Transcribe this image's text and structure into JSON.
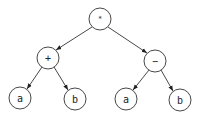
{
  "diagram": {
    "type": "expression-tree",
    "nodes": [
      {
        "id": "root",
        "label": "*",
        "x": 100,
        "y": 19,
        "r": 11
      },
      {
        "id": "plus",
        "label": "+",
        "x": 48,
        "y": 58,
        "r": 11
      },
      {
        "id": "minus",
        "label": "−",
        "x": 155,
        "y": 61,
        "r": 11
      },
      {
        "id": "a1",
        "label": "a",
        "x": 20,
        "y": 98,
        "r": 11
      },
      {
        "id": "b1",
        "label": "b",
        "x": 75,
        "y": 99,
        "r": 11
      },
      {
        "id": "a2",
        "label": "a",
        "x": 126,
        "y": 99,
        "r": 11
      },
      {
        "id": "b2",
        "label": "b",
        "x": 180,
        "y": 100,
        "r": 11
      }
    ],
    "edges": [
      {
        "from": "root",
        "to": "plus"
      },
      {
        "from": "root",
        "to": "minus"
      },
      {
        "from": "plus",
        "to": "a1"
      },
      {
        "from": "plus",
        "to": "b1"
      },
      {
        "from": "minus",
        "to": "a2"
      },
      {
        "from": "minus",
        "to": "b2"
      }
    ],
    "colors": {
      "stroke": "#333333",
      "fill": "#ffffff",
      "text": "#222222"
    }
  }
}
